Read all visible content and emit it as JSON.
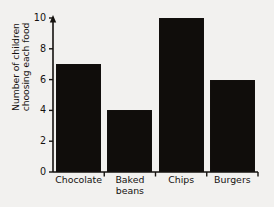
{
  "chart_data": {
    "type": "bar",
    "title": "",
    "xlabel": "",
    "ylabel": "Number of children choosing each food",
    "ylabel_lines": [
      "Number of children",
      "choosing each food"
    ],
    "categories": [
      "Chocolate",
      "Baked beans",
      "Chips",
      "Burgers"
    ],
    "category_lines": [
      [
        "Chocolate"
      ],
      [
        "Baked",
        "beans"
      ],
      [
        "Chips"
      ],
      [
        "Burgers"
      ]
    ],
    "values": [
      7,
      4,
      10,
      6
    ],
    "ylim": [
      0,
      10
    ],
    "ytick_values": [
      0,
      2,
      4,
      6,
      8,
      10
    ],
    "ytick_labels": [
      "0",
      "2",
      "4",
      "6",
      "8",
      "10"
    ],
    "grid": false,
    "legend": false,
    "bar_color": "#100d0b",
    "axis_color": "#15120f",
    "background_color": "#f2f1ef",
    "y_axis_arrow": true
  }
}
